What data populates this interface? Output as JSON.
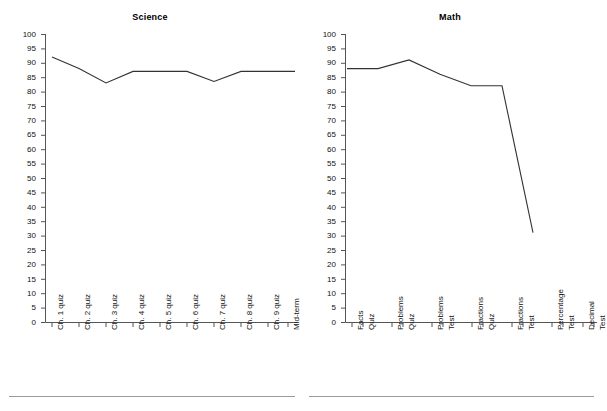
{
  "chart_data": [
    {
      "type": "line",
      "title": "Science",
      "xlabel": "",
      "ylabel": "",
      "ylim": [
        0,
        100
      ],
      "ytick_step": 5,
      "yticks": [
        0,
        5,
        10,
        15,
        20,
        25,
        30,
        35,
        40,
        45,
        50,
        55,
        60,
        65,
        70,
        75,
        80,
        85,
        90,
        95,
        100
      ],
      "grid": false,
      "legend": "none",
      "line_color": "#333333",
      "categories": [
        "Ch. 1 quiz",
        "Ch. 2 quiz",
        "Ch. 3 quiz",
        "Ch. 4 quiz",
        "Ch. 5 quiz",
        "Ch. 6 quiz",
        "Ch. 7 quiz",
        "Ch. 8 quiz",
        "Ch. 9 quiz",
        "Mid-term"
      ],
      "values": [
        92,
        88,
        83,
        87,
        87,
        87,
        83.5,
        87,
        87,
        87
      ]
    },
    {
      "type": "line",
      "title": "Math",
      "xlabel": "",
      "ylabel": "",
      "ylim": [
        0,
        100
      ],
      "ytick_step": 5,
      "yticks": [
        0,
        5,
        10,
        15,
        20,
        25,
        30,
        35,
        40,
        45,
        50,
        55,
        60,
        65,
        70,
        75,
        80,
        85,
        90,
        95,
        100
      ],
      "grid": false,
      "legend": "none",
      "line_color": "#333333",
      "categories": [
        "Facts Quiz",
        "Problems Quiz",
        "Problems Test",
        "Fractions Quiz",
        "Fractions Test",
        "Percentage Test",
        "Decimal Test"
      ],
      "category_lines": [
        [
          "Facts",
          "Quiz"
        ],
        [
          "Problems",
          "Quiz"
        ],
        [
          "Problems",
          "Test"
        ],
        [
          "Fractions",
          "Quiz"
        ],
        [
          "Fractions",
          "Test"
        ],
        [
          "Percentage",
          "Test"
        ],
        [
          "Decimal",
          "Test"
        ]
      ],
      "values": [
        88,
        88,
        91,
        86,
        82,
        82,
        31
      ]
    }
  ],
  "science": {
    "title": "Science",
    "yticks": [
      "100",
      "95",
      "90",
      "85",
      "80",
      "75",
      "70",
      "65",
      "60",
      "55",
      "50",
      "45",
      "40",
      "35",
      "30",
      "25",
      "20",
      "15",
      "10",
      "5",
      "0"
    ],
    "xlabels": [
      "Ch. 1 quiz",
      "Ch. 2 quiz",
      "Ch. 3 quiz",
      "Ch. 4 quiz",
      "Ch. 5 quiz",
      "Ch. 6 quiz",
      "Ch. 7 quiz",
      "Ch. 8 quiz",
      "Ch. 9 quiz",
      "Mid-term"
    ]
  },
  "math": {
    "title": "Math",
    "yticks": [
      "100",
      "95",
      "90",
      "85",
      "80",
      "75",
      "70",
      "65",
      "60",
      "55",
      "50",
      "45",
      "40",
      "35",
      "30",
      "25",
      "20",
      "15",
      "10",
      "5",
      "0"
    ],
    "xlabels_line1": [
      "Facts",
      "Problems",
      "Problems",
      "Fractions",
      "Fractions",
      "Percentage",
      "Decimal"
    ],
    "xlabels_line2": [
      "Quiz",
      "Quiz",
      "Test",
      "Quiz",
      "Test",
      "Test",
      "Test"
    ]
  },
  "colors": {
    "line": "#333333",
    "axis": "#555555",
    "rule": "#9a9a9a",
    "text": "#111111",
    "background": "#ffffff"
  }
}
